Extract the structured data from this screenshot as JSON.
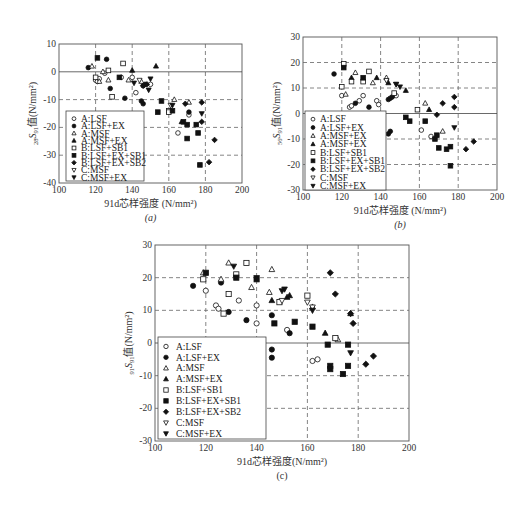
{
  "figure_caption": "",
  "markers": {
    "A:LSF": "circle-open",
    "A:LSF+EX": "circle-filled",
    "A:MSF": "triangle-up-open",
    "A:MSF+EX": "triangle-up-filled",
    "B:LSF+SB1": "square-open",
    "B:LSF+EX+SB1": "square-filled",
    "B:LSF+EX+SB2": "diamond-filled",
    "C:MSF": "triangle-down-open",
    "C:MSF+EX": "triangle-down-filled"
  },
  "chart_data": [
    {
      "id": "a",
      "type": "scatter",
      "panel_label": "(a)",
      "title": "",
      "xlabel": "91d芯样强度 (N/mm²)",
      "ylabel": "28S91值(N/mm²)",
      "ylabel_sub": "28",
      "ylabel_main": "S",
      "ylabel_sub2": "91",
      "ylabel_rest": "值(N/mm²)",
      "xlim": [
        100,
        200
      ],
      "ylim": [
        -40,
        10
      ],
      "xticks": [
        100,
        120,
        140,
        160,
        180,
        200
      ],
      "yticks": [
        10,
        0,
        -10,
        -20,
        -30,
        -40
      ],
      "grid": true,
      "frame": {
        "x0": 59,
        "x1": 242,
        "y0": 44,
        "y1": 183
      },
      "legend": {
        "x": 66,
        "y": 111,
        "w": 78,
        "h": 70
      },
      "legend_entries": [
        "A:LSF",
        "A:LSF+EX",
        "A:MSF",
        "A:MSF+EX",
        "B:LSF+SB1",
        "B:LSF+EX+SB1",
        "B:LSF+EX+SB2",
        "C:MSF",
        "C:MSF+EX"
      ],
      "series": [
        {
          "name": "A:LSF",
          "points": [
            [
              120,
              -3
            ],
            [
              121,
              -3.5
            ],
            [
              122,
              -2.5
            ],
            [
              125,
              -0.5
            ],
            [
              134,
              -2
            ],
            [
              140,
              -2
            ],
            [
              142,
              -7.5
            ],
            [
              150,
              -4.5
            ],
            [
              165,
              -22
            ],
            [
              171,
              -15.5
            ]
          ]
        },
        {
          "name": "A:LSF+EX",
          "points": [
            [
              116,
              1.5
            ],
            [
              126,
              4.5
            ],
            [
              128,
              -6
            ],
            [
              136,
              -9.5
            ],
            [
              145,
              -10.5
            ],
            [
              146,
              -11.5
            ],
            [
              146,
              -5
            ],
            [
              147,
              -4.5
            ],
            [
              171,
              -14.5
            ]
          ]
        },
        {
          "name": "A:MSF",
          "points": [
            [
              118,
              2
            ],
            [
              122,
              -3.5
            ],
            [
              124,
              0
            ],
            [
              127,
              -3
            ],
            [
              138,
              -3
            ],
            [
              145,
              -3.5
            ],
            [
              163,
              -10
            ],
            [
              171,
              -11
            ]
          ]
        },
        {
          "name": "A:MSF+EX",
          "points": [
            [
              140,
              0.5
            ],
            [
              153,
              2
            ],
            [
              167,
              -18
            ]
          ]
        },
        {
          "name": "B:LSF+SB1",
          "points": [
            [
              120,
              -2
            ],
            [
              127,
              0.5
            ],
            [
              129,
              -9
            ],
            [
              135,
              3
            ],
            [
              160,
              -14
            ],
            [
              160,
              -14.5
            ]
          ]
        },
        {
          "name": "B:LSF+EX+SB1",
          "points": [
            [
              121,
              5
            ],
            [
              133,
              -2
            ],
            [
              154,
              -14.5
            ],
            [
              156,
              -10.5
            ],
            [
              162,
              -14
            ],
            [
              168,
              -18
            ],
            [
              170,
              -24
            ],
            [
              170,
              -19
            ],
            [
              175,
              -19
            ],
            [
              176,
              -22
            ],
            [
              177,
              -33.5
            ]
          ]
        },
        {
          "name": "B:LSF+EX+SB2",
          "points": [
            [
              146,
              -5
            ],
            [
              148,
              -4.5
            ],
            [
              169,
              -11.5
            ],
            [
              178,
              -11
            ],
            [
              178,
              -18
            ],
            [
              182,
              -32.5
            ],
            [
              185,
              -24.5
            ]
          ]
        },
        {
          "name": "C:MSF",
          "points": [
            [
              144,
              -3
            ],
            [
              161,
              -12
            ]
          ]
        },
        {
          "name": "C:MSF+EX",
          "points": [
            [
              141,
              -4
            ],
            [
              149,
              -6.5
            ],
            [
              150,
              -2.5
            ],
            [
              162,
              -12
            ],
            [
              178,
              -15
            ]
          ]
        }
      ]
    },
    {
      "id": "b",
      "type": "scatter",
      "panel_label": "(b)",
      "title": "",
      "xlabel": "91d芯样强度 (N/mm²)",
      "ylabel": "56S91值(N/mm²)",
      "ylabel_sub": "56",
      "ylabel_main": "S",
      "ylabel_sub2": "91",
      "ylabel_rest": "值(N/mm²)",
      "xlim": [
        100,
        200
      ],
      "ylim": [
        -30,
        30
      ],
      "xticks": [
        100,
        120,
        140,
        160,
        180,
        200
      ],
      "yticks": [
        30,
        20,
        10,
        0,
        -10,
        -20,
        -30
      ],
      "grid": true,
      "frame": {
        "x0": 303,
        "x1": 497,
        "y0": 37,
        "y1": 190
      },
      "legend": {
        "x": 305,
        "y": 111,
        "w": 81,
        "h": 79
      },
      "legend_entries": [
        "A:LSF",
        "A:LSF+EX",
        "A:MSF+EX",
        "A:MSF+EX",
        "B:LSF+SB1",
        "B:LSF+EX+SB1",
        "B:LSF+EX+SB2",
        "C:MSF",
        "C:MSF+EX"
      ],
      "series": [
        {
          "name": "A:LSF",
          "points": [
            [
              120,
              7
            ],
            [
              124,
              2.5
            ],
            [
              125,
              3
            ],
            [
              129,
              5
            ],
            [
              131,
              7
            ],
            [
              138,
              5
            ],
            [
              139,
              3.5
            ],
            [
              148,
              7
            ],
            [
              161,
              -6.5
            ],
            [
              166,
              -9
            ]
          ]
        },
        {
          "name": "A:LSF+EX",
          "points": [
            [
              116,
              15.5
            ],
            [
              127,
              4
            ],
            [
              134,
              2.5
            ],
            [
              144,
              5.5
            ],
            [
              145,
              6
            ],
            [
              146,
              6.5
            ],
            [
              144,
              -8
            ],
            [
              145,
              -7
            ]
          ]
        },
        {
          "name": "A:MSF",
          "points": [
            [
              122,
              7.5
            ],
            [
              127,
              16
            ],
            [
              136,
              12
            ],
            [
              143,
              14
            ],
            [
              163,
              4
            ],
            [
              172,
              -7
            ]
          ]
        },
        {
          "name": "A:MSF+EX",
          "points": [
            [
              125,
              14
            ],
            [
              138,
              14
            ],
            [
              144,
              12
            ],
            [
              153,
              9
            ],
            [
              165,
              1.5
            ]
          ]
        },
        {
          "name": "B:LSF+SB1",
          "points": [
            [
              120,
              10.5
            ],
            [
              121,
              19.5
            ],
            [
              125,
              12.5
            ],
            [
              131,
              12.5
            ],
            [
              134,
              16.5
            ],
            [
              147,
              8
            ],
            [
              159,
              1.5
            ]
          ]
        },
        {
          "name": "B:LSF+EX+SB1",
          "points": [
            [
              121,
              18
            ],
            [
              131,
              14
            ],
            [
              153,
              -1.5
            ],
            [
              155,
              -3
            ],
            [
              163,
              -3
            ],
            [
              168,
              -10
            ],
            [
              169,
              -8.5
            ],
            [
              170,
              -13.5
            ],
            [
              174,
              -14
            ],
            [
              176,
              -13
            ],
            [
              176,
              -20.5
            ]
          ]
        },
        {
          "name": "B:LSF+EX+SB2",
          "points": [
            [
              169,
              -0.5
            ],
            [
              172,
              4
            ],
            [
              178,
              6.5
            ],
            [
              178,
              2.5
            ],
            [
              184,
              -14
            ],
            [
              188,
              -11
            ]
          ]
        },
        {
          "name": "C:MSF",
          "points": [
            [
              143,
              13
            ],
            [
              148,
              11.5
            ]
          ]
        },
        {
          "name": "C:MSF+EX",
          "points": [
            [
              148,
              11.5
            ],
            [
              150,
              10.5
            ],
            [
              178,
              -5.5
            ]
          ]
        }
      ]
    },
    {
      "id": "c",
      "type": "scatter",
      "panel_label": "(c)",
      "title": "",
      "xlabel": "91d芯样强度(N/mm²)",
      "ylabel": "91S91值(N/mm²)",
      "ylabel_sub": "91",
      "ylabel_main": "S",
      "ylabel_sub2": "91",
      "ylabel_rest": "值(N/mm²)",
      "xlim": [
        100,
        200
      ],
      "ylim": [
        -30,
        30
      ],
      "xticks": [
        100,
        120,
        140,
        160,
        180,
        200
      ],
      "yticks": [
        30,
        20,
        10,
        0,
        -10,
        -20,
        -30
      ],
      "grid": true,
      "frame": {
        "x0": 155,
        "x1": 409,
        "y0": 245,
        "y1": 441
      },
      "legend": {
        "x": 158,
        "y": 337,
        "w": 108,
        "h": 102
      },
      "legend_entries": [
        "A:LSF",
        "A:LSF+EX",
        "A:MSF",
        "A:MSF+EX",
        "B:LSF+SB1",
        "B:LSF+EX+SB1",
        "B:LSF+EX+SB2",
        "C:MSF",
        "C:MSF+EX"
      ],
      "series": [
        {
          "name": "A:LSF",
          "points": [
            [
              120,
              16
            ],
            [
              124,
              11.5
            ],
            [
              125,
              10.5
            ],
            [
              133,
              13
            ],
            [
              140,
              11.5
            ],
            [
              140,
              6
            ],
            [
              152,
              4
            ],
            [
              162,
              -5.5
            ],
            [
              164,
              -5
            ]
          ]
        },
        {
          "name": "A:LSF+EX",
          "points": [
            [
              115,
              17.5
            ],
            [
              126,
              18.5
            ],
            [
              129,
              9.5
            ],
            [
              136,
              7
            ],
            [
              146,
              8.5
            ],
            [
              146,
              -2
            ],
            [
              146,
              -4.5
            ],
            [
              153,
              3
            ]
          ]
        },
        {
          "name": "A:MSF",
          "points": [
            [
              119,
              21.5
            ],
            [
              126,
              19.5
            ],
            [
              129,
              24.5
            ],
            [
              138,
              17
            ],
            [
              146,
              22.5
            ],
            [
              145,
              15.5
            ],
            [
              162,
              11
            ],
            [
              172,
              1
            ]
          ]
        },
        {
          "name": "A:MSF+EX",
          "points": [
            [
              146,
              13
            ],
            [
              152,
              14
            ],
            [
              153,
              14.5
            ],
            [
              167,
              3
            ],
            [
              177,
              9
            ]
          ]
        },
        {
          "name": "B:LSF+SB1",
          "points": [
            [
              119,
              19.5
            ],
            [
              127,
              9
            ],
            [
              129,
              15
            ],
            [
              132,
              21
            ],
            [
              136,
              24.5
            ],
            [
              149,
              12.5
            ],
            [
              160,
              14.5
            ],
            [
              171,
              1.5
            ]
          ]
        },
        {
          "name": "B:LSF+EX+SB1",
          "points": [
            [
              120,
              21.5
            ],
            [
              132,
              20
            ],
            [
              140,
              19.5
            ],
            [
              147,
              6
            ],
            [
              155,
              6.5
            ],
            [
              162,
              5
            ],
            [
              168,
              -0.5
            ],
            [
              169,
              -7
            ],
            [
              169,
              -8
            ],
            [
              174,
              -9.5
            ],
            [
              176,
              -7
            ],
            [
              176,
              -0.5
            ]
          ]
        },
        {
          "name": "B:LSF+EX+SB2",
          "points": [
            [
              169,
              21.5
            ],
            [
              171,
              15
            ],
            [
              177,
              9
            ],
            [
              178,
              6
            ],
            [
              183,
              -6.5
            ],
            [
              186,
              -4
            ]
          ]
        },
        {
          "name": "C:MSF",
          "points": [
            [
              150,
              13
            ],
            [
              160,
              12.5
            ],
            [
              162,
              11
            ]
          ]
        },
        {
          "name": "C:MSF+EX",
          "points": [
            [
              131,
              23.5
            ],
            [
              140,
              20
            ],
            [
              150,
              16
            ],
            [
              151,
              16.5
            ],
            [
              162,
              10
            ],
            [
              177,
              -3
            ]
          ]
        }
      ]
    }
  ]
}
